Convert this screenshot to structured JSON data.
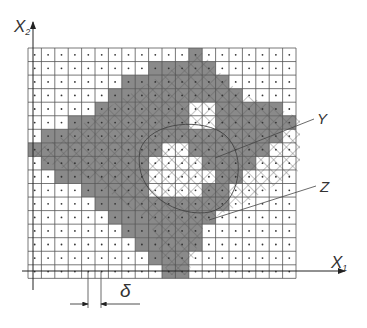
{
  "figure": {
    "axes": {
      "x_axis_label": "X",
      "x_axis_subscript": "1",
      "y_axis_label": "X",
      "y_axis_subscript": "2"
    },
    "annotations": {
      "y_label": "Y",
      "z_label": "Z",
      "delta_label": "δ"
    },
    "grid": {
      "columns": 20,
      "rows": 17,
      "origin_x": 28,
      "origin_y": 48,
      "cell_w": 13.4,
      "cell_h": 13.55,
      "gray_ranges_by_row": [
        [
          [
            12,
            12
          ]
        ],
        [
          [
            9,
            13
          ]
        ],
        [
          [
            7,
            14
          ]
        ],
        [
          [
            6,
            15
          ]
        ],
        [
          [
            5,
            11
          ],
          [
            14,
            18
          ]
        ],
        [
          [
            3,
            11
          ],
          [
            14,
            19
          ]
        ],
        [
          [
            1,
            18
          ]
        ],
        [
          [
            0,
            9
          ],
          [
            12,
            17
          ]
        ],
        [
          [
            1,
            8
          ],
          [
            13,
            16
          ]
        ],
        [
          [
            2,
            8
          ],
          [
            14,
            15
          ]
        ],
        [
          [
            4,
            8
          ],
          [
            13,
            14
          ]
        ],
        [
          [
            5,
            14
          ]
        ],
        [
          [
            6,
            13
          ]
        ],
        [
          [
            7,
            12
          ]
        ],
        [
          [
            8,
            12
          ]
        ],
        [
          [
            9,
            11
          ]
        ],
        [
          [
            10,
            11
          ]
        ]
      ]
    },
    "colors": {
      "gray_fill": "#8a8a8a",
      "grid_line": "#555555",
      "hatch_line": "#5a5a5a",
      "background": "#ffffff"
    }
  }
}
